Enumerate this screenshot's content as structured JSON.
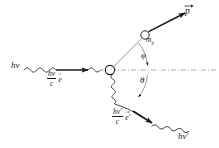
{
  "figure": {
    "domain_type": "diagram",
    "width": 219,
    "height": 148,
    "background_color": "#ffffff",
    "ink_color": "#1a1a1a",
    "axis_color": "#9a9a9a"
  },
  "labels": {
    "incident_photon": "hν",
    "incident_momentum_numerator": "hν",
    "incident_momentum_denominator": "c",
    "incident_unit_vector": "e",
    "scattered_photon": "hν′",
    "scattered_momentum_numerator": "hν′",
    "scattered_momentum_denominator": "c",
    "scattered_unit_vector": "e′",
    "electron_mass": "m",
    "electron_mass_subscript": "e",
    "electron_momentum": "p",
    "angle_phi": "φ",
    "angle_theta": "θ"
  },
  "elements": {
    "incident_wave_name": "incident-photon-wave",
    "incident_arrow_name": "incident-momentum-arrow",
    "vertex_name": "scattering-vertex",
    "electron_track_name": "recoil-electron-line",
    "electron_circle_name": "recoil-electron-marker",
    "electron_arrow_name": "electron-momentum-arrow",
    "scattered_wave_name": "scattered-photon-wave",
    "scattered_arrow_name": "scattered-momentum-arrow",
    "axis_name": "reference-axis-dashdot",
    "phi_arc_name": "phi-angle-arc",
    "theta_arc_name": "theta-angle-arc"
  },
  "geometry": {
    "vertex_x": 110,
    "vertex_y": 70,
    "electron_marker_x": 145,
    "electron_marker_y": 35,
    "axis_y": 70,
    "phi_degrees": 45,
    "theta_degrees": 45
  }
}
